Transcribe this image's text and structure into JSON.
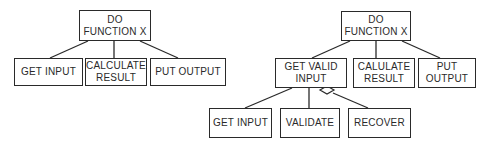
{
  "diagram": {
    "colors": {
      "stroke": "#2a2a2a",
      "background": "#ffffff",
      "text": "#2a2a2a"
    },
    "left_tree": {
      "root": {
        "label": "DO\nFUNCTION X"
      },
      "children": [
        {
          "label": "GET INPUT"
        },
        {
          "label": "CALCULATE\nRESULT"
        },
        {
          "label": "PUT OUTPUT"
        }
      ]
    },
    "right_tree": {
      "root": {
        "label": "DO\nFUNCTION X"
      },
      "children": [
        {
          "label": "GET VALID\nINPUT"
        },
        {
          "label": "CALULATE\nRESULT"
        },
        {
          "label": "PUT\nOUTPUT"
        }
      ],
      "grandchildren": [
        {
          "label": "GET INPUT"
        },
        {
          "label": "VALIDATE"
        },
        {
          "label": "RECOVER",
          "connector": "diamond"
        }
      ]
    }
  }
}
